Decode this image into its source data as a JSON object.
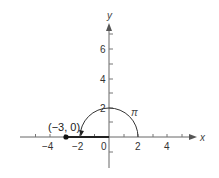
{
  "diagram": {
    "axes": {
      "x_label": "x",
      "y_label": "y",
      "x_ticks": [
        "−4",
        "−2",
        "0",
        "2",
        "4"
      ],
      "y_ticks": [
        "2",
        "4",
        "6"
      ]
    },
    "annotations": {
      "start_point": "(−3, 0)",
      "arc_label": "π"
    },
    "colors": {
      "axis": "#555555",
      "path": "#222222"
    }
  }
}
